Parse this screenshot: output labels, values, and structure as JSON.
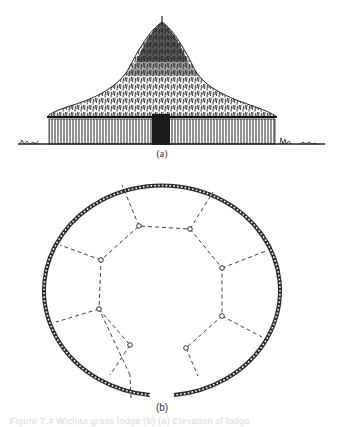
{
  "figure": {
    "panel_a": {
      "label": "(a)",
      "description": "Elevation sketch of a large circular thatched roundhouse with conical roof, vertical-post walls and a central doorway"
    },
    "panel_b": {
      "label": "(b)",
      "description": "Ground plan: ring of closely-spaced wall posts with a gap (doorway) at the bottom, inner ring of 10 roof-support posts joined by dashed lines, with dashed radial lines to the outer wall"
    },
    "caption": "Figure 7.4  Wichita grass lodge (b)  (a) Elevation of lodge"
  },
  "colors": {
    "ink": "#2a2a2a",
    "paper": "#ffffff",
    "caption": "#d8d8d8"
  }
}
